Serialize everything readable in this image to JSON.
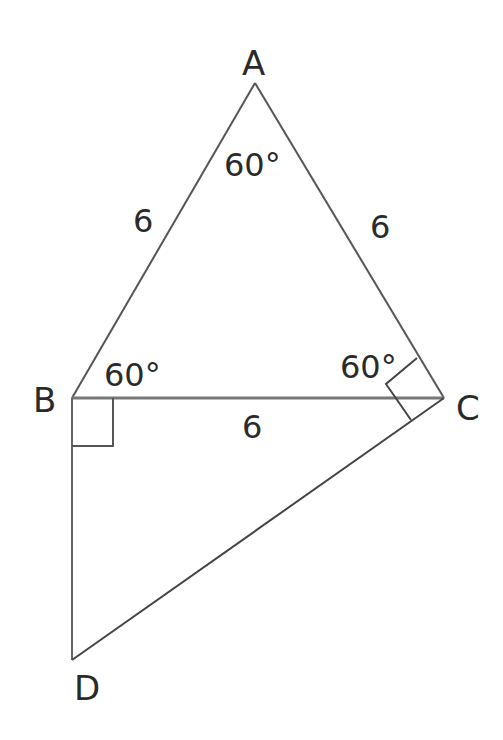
{
  "diagram": {
    "type": "geometry",
    "points": {
      "A": {
        "label": "A"
      },
      "B": {
        "label": "B"
      },
      "C": {
        "label": "C"
      },
      "D": {
        "label": "D"
      }
    },
    "segments": [
      {
        "from": "A",
        "to": "B",
        "label": "6"
      },
      {
        "from": "A",
        "to": "C",
        "label": "6"
      },
      {
        "from": "B",
        "to": "C",
        "label": "6"
      },
      {
        "from": "B",
        "to": "D",
        "label": ""
      },
      {
        "from": "C",
        "to": "D",
        "label": ""
      }
    ],
    "angles": {
      "A": "60°",
      "B": "60°",
      "C": "60°"
    },
    "right_angles": [
      "DBC",
      "ACD"
    ],
    "line_color": "#555555",
    "text_color": "#2a2a2a"
  }
}
